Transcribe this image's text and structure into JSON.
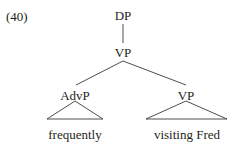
{
  "figure": {
    "example_number": "(40)",
    "type": "syntax-tree",
    "stroke_color": "#3a3a3a",
    "text_color": "#231f20",
    "background_color": "#ffffff"
  },
  "tree": {
    "nodes": [
      {
        "id": "dp",
        "label": "DP"
      },
      {
        "id": "vp",
        "label": "VP"
      },
      {
        "id": "advp",
        "label": "AdvP"
      },
      {
        "id": "vp2",
        "label": "VP"
      }
    ],
    "terminals": [
      {
        "id": "frequently",
        "label": "frequently"
      },
      {
        "id": "visiting",
        "label": "visiting Fred"
      }
    ]
  }
}
